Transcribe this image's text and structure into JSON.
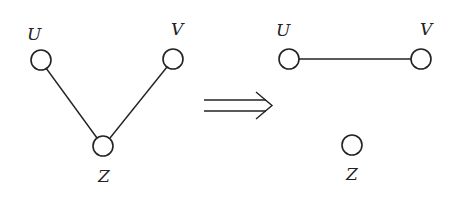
{
  "diagram": {
    "type": "graph-transformation",
    "left_graph": {
      "nodes": [
        {
          "id": "U",
          "label": "U"
        },
        {
          "id": "V",
          "label": "V"
        },
        {
          "id": "Z",
          "label": "Z"
        }
      ],
      "edges": [
        {
          "from": "U",
          "to": "Z"
        },
        {
          "from": "V",
          "to": "Z"
        }
      ]
    },
    "arrow": {
      "symbol": "⟹",
      "meaning": "implies / transforms to"
    },
    "right_graph": {
      "nodes": [
        {
          "id": "U",
          "label": "U"
        },
        {
          "id": "V",
          "label": "V"
        },
        {
          "id": "Z",
          "label": "Z"
        }
      ],
      "edges": [
        {
          "from": "U",
          "to": "V"
        }
      ]
    },
    "colors": {
      "stroke": "#222222",
      "background": "#ffffff"
    }
  }
}
